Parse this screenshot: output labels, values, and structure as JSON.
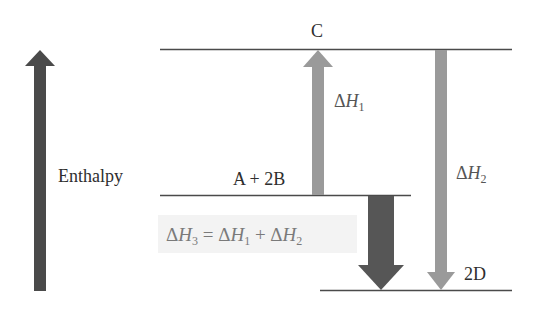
{
  "diagram": {
    "type": "enthalpy-level-diagram",
    "axis": {
      "label": "Enthalpy",
      "direction": "up",
      "color": "#4a4a4a"
    },
    "levels": [
      {
        "id": "C",
        "label": "C"
      },
      {
        "id": "reactants",
        "label": "A + 2B"
      },
      {
        "id": "products",
        "label": "2D"
      }
    ],
    "arrows": [
      {
        "id": "dH1",
        "from": "A + 2B",
        "to": "C",
        "direction": "up",
        "symbol": "ΔH",
        "subscript": "1",
        "color": "#9a9a9a"
      },
      {
        "id": "dH2",
        "from": "C",
        "to": "2D",
        "direction": "down",
        "symbol": "ΔH",
        "subscript": "2",
        "color": "#9a9a9a"
      },
      {
        "id": "dH3",
        "from": "A + 2B",
        "to": "2D",
        "direction": "down",
        "symbol": "ΔH",
        "subscript": "3",
        "color": "#555555"
      }
    ],
    "equation": {
      "lhs_delta": "Δ",
      "lhs_var": "H",
      "lhs_sub": "3",
      "eq": " = ",
      "t1_delta": "Δ",
      "t1_var": "H",
      "t1_sub": "1",
      "plus": " + ",
      "t2_delta": "Δ",
      "t2_var": "H",
      "t2_sub": "2",
      "text": "ΔH3 = ΔH1 + ΔH2",
      "background": "#f3f3f3"
    }
  }
}
